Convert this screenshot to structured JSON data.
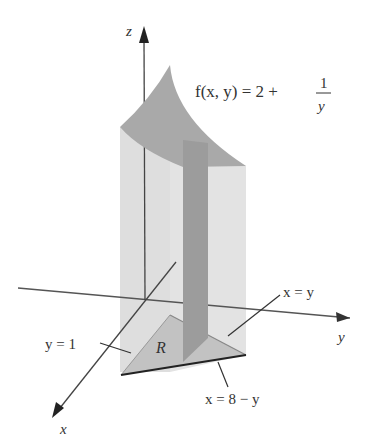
{
  "figure": {
    "function_label": {
      "lhs": "f(x, y) = 2 +",
      "frac_num": "1",
      "frac_den": "y"
    },
    "axes": {
      "x": "x",
      "y": "y",
      "z": "z"
    },
    "region_label": "R",
    "boundary_labels": {
      "y_eq_1": "y = 1",
      "x_eq_y": "x = y",
      "x_eq_8_minus_y": "x = 8 − y"
    },
    "colors": {
      "top_surface": "#a8a8a8",
      "side_walls": "#d9d9d9",
      "slab": "#9a9a9a",
      "region": "#c4c4c4",
      "axes": "#444444",
      "boundary_dark": "#222222"
    }
  }
}
